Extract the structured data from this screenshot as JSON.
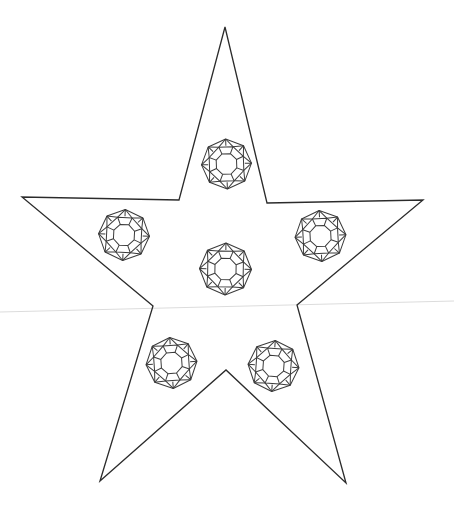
{
  "canvas": {
    "width": 454,
    "height": 507,
    "background_color": "#ffffff",
    "title": "Star outline with six cushion-cut gem line drawings"
  },
  "style": {
    "star_stroke_color": "#2b2b2b",
    "star_stroke_width": 1.3,
    "star_fill": "none",
    "gem_stroke_color": "#3a3a3a",
    "gem_stroke_width": 1.0,
    "gem_fill": "none",
    "guide_line_color": "#dcdcdc",
    "guide_line_width": 1.2
  },
  "star": {
    "name": "five-pointed-star",
    "points": [
      {
        "label": "top-tip",
        "x": 225,
        "y": 27
      },
      {
        "label": "upper-right-inner",
        "x": 267,
        "y": 203
      },
      {
        "label": "right-tip",
        "x": 423,
        "y": 200
      },
      {
        "label": "lower-right-inner",
        "x": 297,
        "y": 305
      },
      {
        "label": "bottom-right-tip",
        "x": 346,
        "y": 483
      },
      {
        "label": "bottom-inner",
        "x": 226,
        "y": 370
      },
      {
        "label": "bottom-left-tip",
        "x": 100,
        "y": 481
      },
      {
        "label": "lower-left-inner",
        "x": 153,
        "y": 306
      },
      {
        "label": "left-tip",
        "x": 22,
        "y": 197
      },
      {
        "label": "upper-left-inner",
        "x": 179,
        "y": 200
      }
    ]
  },
  "guide_line": {
    "name": "horizon-guide-line",
    "x1": 0,
    "y1": 312,
    "x2": 454,
    "y2": 301
  },
  "gems": [
    {
      "id": "gem-top",
      "label": "top gem",
      "cx": 226.5,
      "cy": 164.0,
      "r": 25.0,
      "rotation": -2
    },
    {
      "id": "gem-left",
      "label": "left gem",
      "cx": 124.0,
      "cy": 235.0,
      "r": 25.5,
      "rotation": 3
    },
    {
      "id": "gem-right",
      "label": "right gem",
      "cx": 320.5,
      "cy": 236.0,
      "r": 25.5,
      "rotation": -3
    },
    {
      "id": "gem-center",
      "label": "center gem",
      "cx": 225.5,
      "cy": 269.0,
      "r": 26.0,
      "rotation": 1
    },
    {
      "id": "gem-bottom-left",
      "label": "bottom left gem",
      "cx": 171.5,
      "cy": 363.0,
      "r": 25.5,
      "rotation": -4
    },
    {
      "id": "gem-bottom-right",
      "label": "bottom right gem",
      "cx": 273.5,
      "cy": 366.0,
      "r": 25.5,
      "rotation": 4
    }
  ],
  "gem_geometry": {
    "description": "cushion-cut brilliant gem: octagonal girdle outline, an inner octagon table, and star/kite facets between them",
    "sides": 8,
    "outer_corner_radius_ratio": 1.0,
    "mid_ring_ratio": 0.74,
    "table_ratio": 0.44,
    "facet_pattern": "alternating kite and star facets"
  }
}
